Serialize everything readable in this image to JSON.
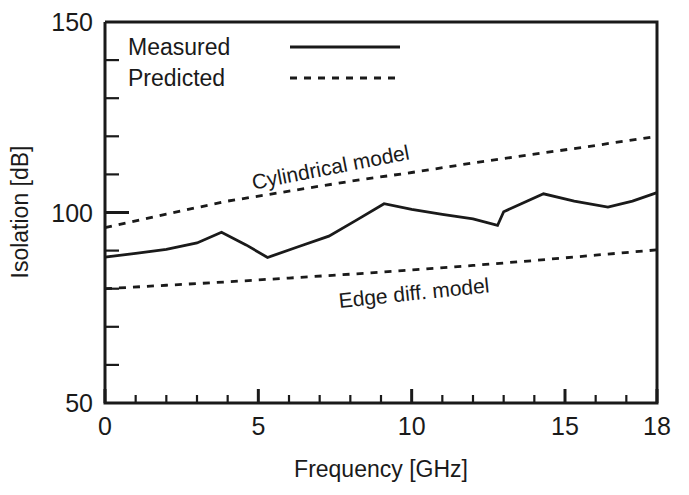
{
  "chart_data": {
    "type": "line",
    "title": "",
    "xlabel": "Frequency  [GHz]",
    "ylabel": "Isolation  [dB]",
    "xlim": [
      0,
      18
    ],
    "ylim": [
      50,
      150
    ],
    "grid": false,
    "x_ticks_major": [
      0,
      5,
      10,
      15,
      18
    ],
    "x_tick_labels": [
      "0",
      "5",
      "10",
      "15",
      "18"
    ],
    "x_ticks_minor": [
      1,
      2,
      3,
      4,
      6,
      7,
      8,
      9,
      11,
      12,
      13,
      14,
      16,
      17
    ],
    "y_ticks_major": [
      50,
      100,
      150
    ],
    "y_tick_labels": [
      "50",
      "100",
      "150"
    ],
    "y_ticks_minor": [
      60,
      70,
      80,
      90,
      110,
      120,
      130,
      140
    ],
    "legend_position": "top-left-inside",
    "legend": [
      {
        "label": "Measured",
        "style": "solid"
      },
      {
        "label": "Predicted",
        "style": "dashed"
      }
    ],
    "annotations": [
      {
        "text": "Cylindrical model",
        "x": 7.4,
        "y": 110,
        "rotation": -11
      },
      {
        "text": "Edge diff. model",
        "x": 10.1,
        "y": 77,
        "rotation": -6
      }
    ],
    "series": [
      {
        "name": "Measured",
        "style": "solid",
        "x": [
          0,
          1.0,
          2.0,
          3.0,
          3.8,
          4.6,
          5.3,
          6.3,
          7.3,
          8.2,
          9.1,
          10.0,
          11.0,
          12.0,
          12.8,
          13.0,
          14.3,
          15.3,
          16.4,
          17.2,
          18.0
        ],
        "y": [
          88.3,
          89.3,
          90.3,
          92.0,
          94.8,
          91.5,
          88.2,
          91.0,
          93.8,
          98.0,
          102.3,
          100.8,
          99.5,
          98.3,
          96.6,
          100.2,
          104.9,
          103.0,
          101.4,
          103.0,
          105.2
        ]
      },
      {
        "name": "Cylindrical model",
        "style": "dashed",
        "x": [
          0,
          2,
          4,
          6,
          8,
          10,
          12,
          14,
          16,
          18
        ],
        "y": [
          96.0,
          99.6,
          103.0,
          105.6,
          108.2,
          110.5,
          113.0,
          115.3,
          117.6,
          120.0
        ]
      },
      {
        "name": "Edge diff. model",
        "style": "dashed",
        "x": [
          0,
          2,
          4,
          6,
          8,
          10,
          12,
          14,
          16,
          18
        ],
        "y": [
          80.0,
          80.9,
          81.8,
          82.8,
          83.8,
          84.9,
          86.1,
          87.4,
          88.8,
          90.2
        ]
      }
    ]
  },
  "colors": {
    "ink": "#1a1a1a",
    "background": "#ffffff"
  }
}
